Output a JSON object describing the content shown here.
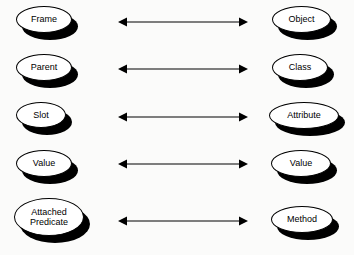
{
  "diagram": {
    "type": "mapping-diagram",
    "title": "",
    "background_color": "#fbfbfa",
    "node_fill_color": "#ffffff",
    "node_stroke_color": "#000000",
    "node_shadow_color": "#000000",
    "arrow_color": "#000000",
    "columns": [
      {
        "name": "frame-terminology"
      },
      {
        "name": "object-oriented-terminology"
      }
    ],
    "rows": [
      {
        "left": {
          "label": "Frame",
          "name": "node-frame",
          "w": 56,
          "h": 27,
          "x": 16,
          "y": 6
        },
        "right": {
          "label": "Object",
          "name": "node-object",
          "w": 59,
          "h": 27,
          "x": 272,
          "y": 6
        },
        "arrow": {
          "name": "arrow-frame-object",
          "x": 118,
          "y": 15,
          "w": 130,
          "direction": "bidirectional"
        }
      },
      {
        "left": {
          "label": "Parent",
          "name": "node-parent",
          "w": 56,
          "h": 27,
          "x": 16,
          "y": 54
        },
        "right": {
          "label": "Class",
          "name": "node-class",
          "w": 56,
          "h": 27,
          "x": 272,
          "y": 54
        },
        "arrow": {
          "name": "arrow-parent-class",
          "x": 118,
          "y": 62,
          "w": 130,
          "direction": "bidirectional"
        }
      },
      {
        "left": {
          "label": "Slot",
          "name": "node-slot",
          "w": 50,
          "h": 26,
          "x": 16,
          "y": 102
        },
        "right": {
          "label": "Attribute",
          "name": "node-attribute",
          "w": 70,
          "h": 27,
          "x": 269,
          "y": 102
        },
        "arrow": {
          "name": "arrow-slot-attribute",
          "x": 118,
          "y": 110,
          "w": 130,
          "direction": "bidirectional"
        }
      },
      {
        "left": {
          "label": "Value",
          "name": "node-value-left",
          "w": 56,
          "h": 27,
          "x": 16,
          "y": 150
        },
        "right": {
          "label": "Value",
          "name": "node-value-right",
          "w": 60,
          "h": 27,
          "x": 271,
          "y": 150
        },
        "arrow": {
          "name": "arrow-value-value",
          "x": 118,
          "y": 157,
          "w": 130,
          "direction": "bidirectional"
        }
      },
      {
        "left": {
          "label": "Attached\nPredicate",
          "name": "node-attached-predicate",
          "w": 70,
          "h": 38,
          "x": 14,
          "y": 198
        },
        "right": {
          "label": "Method",
          "name": "node-method",
          "w": 62,
          "h": 27,
          "x": 271,
          "y": 206
        },
        "arrow": {
          "name": "arrow-attached-predicate-method",
          "x": 118,
          "y": 214,
          "w": 130,
          "direction": "bidirectional"
        }
      }
    ]
  }
}
